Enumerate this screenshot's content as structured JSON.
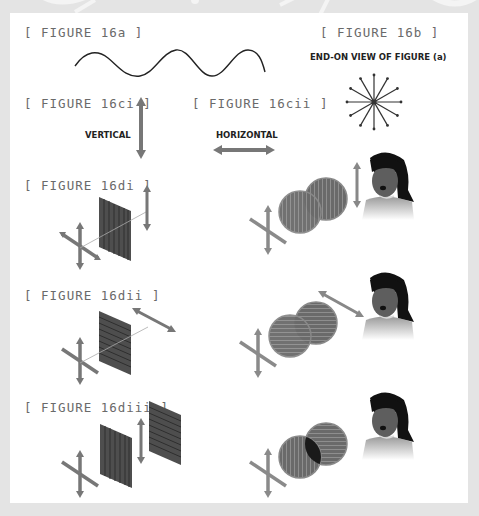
{
  "figures": {
    "f16a": {
      "label": "[ FIGURE 16a ]"
    },
    "f16b": {
      "label": "[ FIGURE 16b ]",
      "caption": "END-ON VIEW OF FIGURE (a)"
    },
    "f16ci": {
      "label": "[ FIGURE 16ci ]",
      "caption": "VERTICAL"
    },
    "f16cii": {
      "label": "[ FIGURE 16cii ]",
      "caption": "HORIZONTAL"
    },
    "f16di": {
      "label": "[ FIGURE 16di ]"
    },
    "f16dii": {
      "label": "[ FIGURE 16dii ]"
    },
    "f16diii": {
      "label": "[ FIGURE 16diii ]"
    }
  },
  "colors": {
    "background": "#e4e4e4",
    "card": "#ffffff",
    "arrow": "#777777",
    "filter": "#555555",
    "lens": "#6a6a6a",
    "label": "#6a6a6a"
  }
}
